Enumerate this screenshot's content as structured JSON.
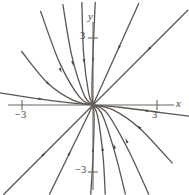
{
  "figure": {
    "type": "phase-portrait",
    "background": "#ffffff",
    "width": 189,
    "height": 195
  },
  "axes": {
    "x_label": "x",
    "y_label": "y",
    "origin_px": [
      93,
      105
    ],
    "units_per_px": 0.0448,
    "px_per_unit": 22.3,
    "x_axis_y_px": 105,
    "y_axis_x_px": 93,
    "stroke": "#6b6661",
    "ticks": [
      {
        "name": "x-negative-three",
        "label": "−3",
        "axis": "x",
        "value": -3,
        "px": 22
      },
      {
        "name": "x-positive-three",
        "label": "3",
        "axis": "x",
        "value": 3,
        "px": 157
      },
      {
        "name": "y-positive-three",
        "label": "3",
        "axis": "y",
        "value": 3,
        "px": 38
      },
      {
        "name": "y-negative-three",
        "label": "−3",
        "axis": "y",
        "value": -3,
        "px": 172
      }
    ]
  },
  "chart_data": {
    "type": "line",
    "title": "",
    "xlabel": "x",
    "ylabel": "y",
    "xlim": [
      -4.2,
      4.3
    ],
    "ylim": [
      -4.0,
      4.7
    ],
    "grid": false,
    "legend": null,
    "equilibrium": {
      "x": 0,
      "y": 0,
      "classification": "stable node",
      "stability": "asymptotically stable"
    },
    "flow_direction": "inward",
    "stroke_color": "#5a5550",
    "arrow_color": "#4a4540",
    "stroke_width": 1.3,
    "series": [
      {
        "name": "straight-ray-upper-right-outer",
        "kind": "straight",
        "points": [
          [
            4.25,
            4.25
          ],
          [
            0,
            0
          ]
        ],
        "arrow_at": [
          2.5,
          2.5
        ]
      },
      {
        "name": "straight-ray-upper-right-inner",
        "kind": "straight",
        "points": [
          [
            2.05,
            4.55
          ],
          [
            0,
            0
          ]
        ],
        "arrow_at": [
          1.15,
          2.55
        ]
      },
      {
        "name": "straight-ray-lower-left-outer",
        "kind": "straight",
        "points": [
          [
            -4.0,
            -4.0
          ],
          [
            0,
            0
          ]
        ],
        "arrow_at": [
          -2.2,
          -2.2
        ]
      },
      {
        "name": "straight-ray-lower-left-inner",
        "kind": "straight",
        "points": [
          [
            -1.95,
            -4.0
          ],
          [
            0,
            0
          ]
        ],
        "arrow_at": [
          -1.05,
          -2.15
        ]
      },
      {
        "name": "curve-upper-left-1",
        "kind": "curved",
        "points": [
          [
            -4.2,
            0.55
          ],
          [
            -2.6,
            0.3
          ],
          [
            -1.2,
            0.12
          ],
          [
            0,
            0
          ]
        ],
        "arrow_at": [
          -2.35,
          0.27
        ]
      },
      {
        "name": "curve-upper-left-2",
        "kind": "curved",
        "points": [
          [
            -3.2,
            2.4
          ],
          [
            -2.05,
            1.0
          ],
          [
            -0.9,
            0.22
          ],
          [
            0,
            0
          ]
        ],
        "arrow_at": [
          -2.0,
          0.95
        ]
      },
      {
        "name": "curve-upper-left-3",
        "kind": "curved",
        "points": [
          [
            -2.35,
            4.2
          ],
          [
            -1.5,
            1.9
          ],
          [
            -0.6,
            0.35
          ],
          [
            0,
            0
          ]
        ],
        "arrow_at": [
          -1.45,
          1.55
        ]
      },
      {
        "name": "curve-upper-left-4",
        "kind": "curved",
        "points": [
          [
            -1.35,
            4.5
          ],
          [
            -0.95,
            2.2
          ],
          [
            -0.4,
            0.45
          ],
          [
            0,
            0
          ]
        ],
        "arrow_at": [
          -0.9,
          1.85
        ]
      },
      {
        "name": "curve-upper-left-5",
        "kind": "curved",
        "points": [
          [
            -0.5,
            4.6
          ],
          [
            -0.42,
            2.3
          ],
          [
            -0.2,
            0.55
          ],
          [
            0,
            0
          ]
        ],
        "arrow_at": [
          -0.4,
          1.95
        ]
      },
      {
        "name": "curve-upper-left-6",
        "kind": "curved",
        "points": [
          [
            0.1,
            4.6
          ],
          [
            0.0,
            2.3
          ],
          [
            -0.05,
            0.6
          ],
          [
            0,
            0
          ]
        ],
        "arrow_at": [
          0.0,
          2.0
        ]
      },
      {
        "name": "curve-lower-right-1",
        "kind": "curved",
        "points": [
          [
            4.3,
            -0.5
          ],
          [
            2.6,
            -0.28
          ],
          [
            1.2,
            -0.1
          ],
          [
            0,
            0
          ]
        ],
        "arrow_at": [
          2.35,
          -0.25
        ]
      },
      {
        "name": "curve-lower-right-2",
        "kind": "curved",
        "points": [
          [
            3.55,
            -2.6
          ],
          [
            2.1,
            -1.05
          ],
          [
            0.9,
            -0.22
          ],
          [
            0,
            0
          ]
        ],
        "arrow_at": [
          2.05,
          -0.98
        ]
      },
      {
        "name": "curve-lower-right-3",
        "kind": "curved",
        "points": [
          [
            2.5,
            -4.0
          ],
          [
            1.55,
            -1.95
          ],
          [
            0.62,
            -0.35
          ],
          [
            0,
            0
          ]
        ],
        "arrow_at": [
          1.5,
          -1.6
        ]
      },
      {
        "name": "curve-lower-right-4",
        "kind": "curved",
        "points": [
          [
            1.45,
            -4.0
          ],
          [
            1.0,
            -2.2
          ],
          [
            0.42,
            -0.45
          ],
          [
            0,
            0
          ]
        ],
        "arrow_at": [
          0.95,
          -1.85
        ]
      },
      {
        "name": "curve-lower-right-5",
        "kind": "curved",
        "points": [
          [
            0.55,
            -4.0
          ],
          [
            0.45,
            -2.3
          ],
          [
            0.22,
            -0.55
          ],
          [
            0,
            0
          ]
        ],
        "arrow_at": [
          0.43,
          -1.95
        ]
      },
      {
        "name": "curve-lower-right-6",
        "kind": "curved",
        "points": [
          [
            -0.1,
            -4.0
          ],
          [
            0.0,
            -2.3
          ],
          [
            0.05,
            -0.6
          ],
          [
            0,
            0
          ]
        ],
        "arrow_at": [
          0.0,
          -2.0
        ]
      }
    ]
  }
}
